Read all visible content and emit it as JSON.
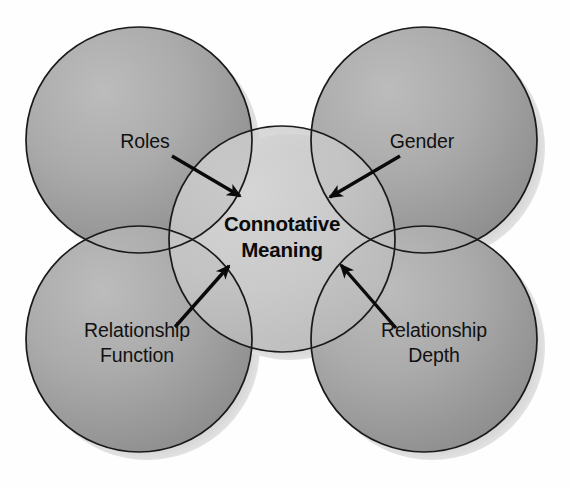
{
  "diagram": {
    "title_center": {
      "line1": "Connotative",
      "line2": "Meaning"
    },
    "nodes": [
      {
        "id": "roles",
        "label": "Roles",
        "position": "top-left",
        "label_x": 145,
        "label_y": 148,
        "arrow": {
          "x1": 172,
          "y1": 156,
          "x2": 240,
          "y2": 196
        }
      },
      {
        "id": "gender",
        "label": "Gender",
        "position": "top-right",
        "label_x": 422,
        "label_y": 148,
        "arrow": {
          "x1": 400,
          "y1": 156,
          "x2": 330,
          "y2": 197
        }
      },
      {
        "id": "relationship-function",
        "label_line1": "Relationship",
        "label_line2": "Function",
        "position": "bottom-left",
        "label_x": 137,
        "label_y": 337,
        "arrow": {
          "x1": 175,
          "y1": 327,
          "x2": 229,
          "y2": 266
        }
      },
      {
        "id": "relationship-depth",
        "label_line1": "Relationship",
        "label_line2": "Depth",
        "position": "bottom-right",
        "label_x": 434,
        "label_y": 337,
        "arrow": {
          "x1": 396,
          "y1": 328,
          "x2": 341,
          "y2": 265
        }
      }
    ],
    "geometry": {
      "outer_radius": 113,
      "center_radius": 113,
      "circles": [
        {
          "id": "top-left",
          "cx": 139,
          "cy": 140
        },
        {
          "id": "top-right",
          "cx": 424,
          "cy": 140
        },
        {
          "id": "bottom-left",
          "cx": 139,
          "cy": 339
        },
        {
          "id": "bottom-right",
          "cx": 424,
          "cy": 339
        }
      ],
      "center_circle": {
        "cx": 282,
        "cy": 239
      }
    },
    "colors": {
      "background": "#ffffff",
      "circle_fill_light": "#b4b4b4",
      "circle_fill_dark": "#8d8d8d",
      "center_fill_light": "#d2d2d2",
      "center_fill_dark": "#bcbcbc",
      "outline": "#1a1a1a",
      "shadow": "#c9c9c9",
      "text": "#111111"
    }
  }
}
